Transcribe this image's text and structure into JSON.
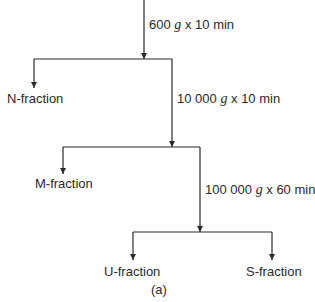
{
  "diagram": {
    "type": "flowchart",
    "caption": "(a)",
    "steps": [
      {
        "speed": "600",
        "unit": "g",
        "sep": "x",
        "time": "10 min"
      },
      {
        "speed": "10 000",
        "unit": "g",
        "sep": "x",
        "time": "10 min"
      },
      {
        "speed": "100 000",
        "unit": "g",
        "sep": "x",
        "time": "60 min"
      }
    ],
    "fractions": {
      "n": "N-fraction",
      "m": "M-fraction",
      "u": "U-fraction",
      "s": "S-fraction"
    }
  }
}
